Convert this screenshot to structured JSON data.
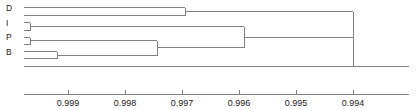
{
  "figure": {
    "type": "dendrogram",
    "background_color": "#ffffff",
    "line_color": "#808080",
    "text_color": "#1a1a1a",
    "width": 416,
    "height": 109
  },
  "axis": {
    "label": "",
    "orientation": "horizontal-reversed",
    "tick_labels": [
      "0.999",
      "0.998",
      "0.997",
      "0.996",
      "0.995",
      "0.994"
    ],
    "tick_values": [
      0.999,
      0.998,
      0.997,
      0.996,
      0.995,
      0.994
    ],
    "tick_x": [
      68,
      125,
      182,
      239,
      296,
      353
    ],
    "axis_start_x": 24,
    "axis_end_x": 409,
    "domain_left": 0.99958,
    "domain_right": 0.99332
  },
  "leaves": {
    "labels": [
      "D",
      "I",
      "P",
      "B"
    ],
    "label_x": 6,
    "label_y": [
      11,
      26,
      40,
      55
    ],
    "tips": [
      {
        "group": "D",
        "y": 7
      },
      {
        "group": "D",
        "y": 15
      },
      {
        "group": "I",
        "y": 22
      },
      {
        "group": "I",
        "y": 30
      },
      {
        "group": "P",
        "y": 37
      },
      {
        "group": "P",
        "y": 44
      },
      {
        "group": "B",
        "y": 51
      },
      {
        "group": "B",
        "y": 58
      }
    ],
    "tip_start_x": 24
  },
  "chart_data": {
    "type": "dendrogram",
    "title": "",
    "xlabel": "",
    "ylabel": "",
    "xlim": [
      0.99958,
      0.99332
    ],
    "axis_reversed": true,
    "categories": [
      "D",
      "I",
      "P",
      "B"
    ],
    "leaf_labels": [
      "D",
      "D",
      "I",
      "I",
      "P",
      "P",
      "B",
      "B"
    ],
    "merges": [
      {
        "name": "I-pair",
        "height": 0.999455,
        "x": 30,
        "children_y": [
          22,
          30
        ],
        "node_y": 26
      },
      {
        "name": "P-pair",
        "height": 0.999455,
        "x": 30,
        "children_y": [
          37,
          44
        ],
        "node_y": 40
      },
      {
        "name": "B-pair",
        "height": 0.99893,
        "x": 57,
        "children_y": [
          51,
          58
        ],
        "node_y": 55
      },
      {
        "name": "P+B",
        "height": 0.997745,
        "x": 157,
        "children_y": [
          40,
          55
        ],
        "node_y": 47
      },
      {
        "name": "D-pair",
        "height": 0.997055,
        "x": 185,
        "children_y": [
          7,
          15
        ],
        "node_y": 11
      },
      {
        "name": "I+(P+B)",
        "height": 0.99603,
        "x": 244,
        "children_y": [
          26,
          47
        ],
        "node_y": 37
      },
      {
        "name": "root",
        "height": 0.994,
        "x": 353,
        "children_y": [
          11,
          37
        ],
        "node_y": 66
      }
    ],
    "baseline_y": 66,
    "grid": false,
    "legend": null
  }
}
